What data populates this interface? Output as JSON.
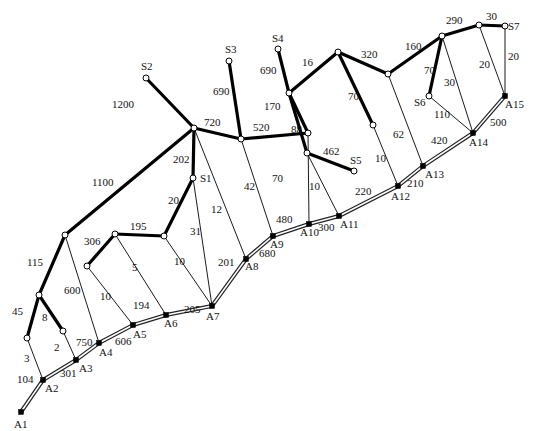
{
  "diagram": {
    "trunk_nodes": [
      {
        "id": "A1",
        "x": 21,
        "y": 412,
        "lx": 14,
        "ly": 428
      },
      {
        "id": "A2",
        "x": 43,
        "y": 380,
        "lx": 45,
        "ly": 392
      },
      {
        "id": "A3",
        "x": 76,
        "y": 360,
        "lx": 79,
        "ly": 372
      },
      {
        "id": "A4",
        "x": 99,
        "y": 343,
        "lx": 99,
        "ly": 356
      },
      {
        "id": "A5",
        "x": 133,
        "y": 325,
        "lx": 133,
        "ly": 338
      },
      {
        "id": "A6",
        "x": 166,
        "y": 315,
        "lx": 164,
        "ly": 327
      },
      {
        "id": "A7",
        "x": 212,
        "y": 306,
        "lx": 206,
        "ly": 320
      },
      {
        "id": "A8",
        "x": 246,
        "y": 259,
        "lx": 245,
        "ly": 270
      },
      {
        "id": "A9",
        "x": 273,
        "y": 236,
        "lx": 270,
        "ly": 248
      },
      {
        "id": "A10",
        "x": 309,
        "y": 224,
        "lx": 300,
        "ly": 236
      },
      {
        "id": "A11",
        "x": 339,
        "y": 216,
        "lx": 340,
        "ly": 228
      },
      {
        "id": "A12",
        "x": 398,
        "y": 186,
        "lx": 391,
        "ly": 200
      },
      {
        "id": "A13",
        "x": 423,
        "y": 166,
        "lx": 425,
        "ly": 178
      },
      {
        "id": "A14",
        "x": 473,
        "y": 133,
        "lx": 469,
        "ly": 146
      },
      {
        "id": "A15",
        "x": 505,
        "y": 96,
        "lx": 505,
        "ly": 108
      }
    ],
    "trunk_segments": [
      {
        "from": "A1",
        "to": "A2",
        "label": "104",
        "lx": 17,
        "ly": 383
      },
      {
        "from": "A2",
        "to": "A3",
        "label": "301",
        "lx": 60,
        "ly": 377
      },
      {
        "from": "A3",
        "to": "A4",
        "label": "750",
        "lx": 76,
        "ly": 346
      },
      {
        "from": "A4",
        "to": "A5",
        "label": "606",
        "lx": 115,
        "ly": 345
      },
      {
        "from": "A5",
        "to": "A6",
        "label": "194",
        "lx": 133,
        "ly": 309
      },
      {
        "from": "A6",
        "to": "A7",
        "label": "205",
        "lx": 184,
        "ly": 313
      },
      {
        "from": "A7",
        "to": "A8",
        "label": "201",
        "lx": 218,
        "ly": 266
      },
      {
        "from": "A8",
        "to": "A9",
        "label": "680",
        "lx": 259,
        "ly": 257
      },
      {
        "from": "A9",
        "to": "A10",
        "label": "480",
        "lx": 276,
        "ly": 223
      },
      {
        "from": "A10",
        "to": "A11",
        "label": "300",
        "lx": 318,
        "ly": 231
      },
      {
        "from": "A11",
        "to": "A12",
        "label": "220",
        "lx": 355,
        "ly": 195
      },
      {
        "from": "A12",
        "to": "A13",
        "label": "210",
        "lx": 407,
        "ly": 187
      },
      {
        "from": "A13",
        "to": "A14",
        "label": "420",
        "lx": 431,
        "ly": 144
      },
      {
        "from": "A14",
        "to": "A15",
        "label": "500",
        "lx": 490,
        "ly": 126
      }
    ],
    "open_nodes": [
      {
        "id": "S1",
        "x": 193,
        "y": 178,
        "label": "S1",
        "lx": 200,
        "ly": 182
      },
      {
        "id": "S2",
        "x": 146,
        "y": 78,
        "label": "S2",
        "lx": 141,
        "ly": 70
      },
      {
        "id": "S3",
        "x": 229,
        "y": 61,
        "label": "S3",
        "lx": 225,
        "ly": 53
      },
      {
        "id": "S4",
        "x": 278,
        "y": 49,
        "label": "S4",
        "lx": 272,
        "ly": 42
      },
      {
        "id": "S5",
        "x": 354,
        "y": 171,
        "label": "S5",
        "lx": 350,
        "ly": 164
      },
      {
        "id": "S6",
        "x": 429,
        "y": 96,
        "label": "S6",
        "lx": 414,
        "ly": 106
      },
      {
        "id": "S7",
        "x": 505,
        "y": 26,
        "label": "S7",
        "lx": 508,
        "ly": 30
      },
      {
        "id": "J720",
        "x": 194,
        "y": 128,
        "label": ""
      },
      {
        "id": "J520",
        "x": 241,
        "y": 139,
        "label": ""
      },
      {
        "id": "J88",
        "x": 308,
        "y": 133,
        "label": ""
      },
      {
        "id": "J170",
        "x": 289,
        "y": 93,
        "label": ""
      },
      {
        "id": "Jtop",
        "x": 338,
        "y": 52,
        "label": ""
      },
      {
        "id": "J320",
        "x": 388,
        "y": 74,
        "label": ""
      },
      {
        "id": "J160",
        "x": 442,
        "y": 36,
        "label": ""
      },
      {
        "id": "J290",
        "x": 479,
        "y": 25,
        "label": ""
      },
      {
        "id": "J70",
        "x": 373,
        "y": 125,
        "label": ""
      },
      {
        "id": "J462",
        "x": 307,
        "y": 153,
        "label": ""
      },
      {
        "id": "J1100",
        "x": 65,
        "y": 235,
        "label": ""
      },
      {
        "id": "J115",
        "x": 39,
        "y": 295,
        "label": ""
      },
      {
        "id": "J45",
        "x": 27,
        "y": 338,
        "label": ""
      },
      {
        "id": "J8",
        "x": 63,
        "y": 331,
        "label": ""
      },
      {
        "id": "J306",
        "x": 87,
        "y": 266,
        "label": ""
      },
      {
        "id": "J195a",
        "x": 115,
        "y": 234,
        "label": ""
      },
      {
        "id": "J195b",
        "x": 164,
        "y": 236,
        "label": ""
      }
    ],
    "thick_edges": [
      {
        "from": "J720",
        "to": "S2",
        "label": "1200",
        "lx": 112,
        "ly": 108
      },
      {
        "from": "J720",
        "to": "J520",
        "label": "720",
        "lx": 204,
        "ly": 126
      },
      {
        "from": "J720",
        "to": "S1",
        "label": "202",
        "lx": 173,
        "ly": 163
      },
      {
        "from": "J720",
        "to": "J1100",
        "label": "1100",
        "lx": 92,
        "ly": 186
      },
      {
        "from": "J520",
        "to": "S3",
        "label": "690",
        "lx": 213,
        "ly": 95
      },
      {
        "from": "J520",
        "to": "J88",
        "label": "520",
        "lx": 253,
        "ly": 131
      },
      {
        "from": "J88",
        "to": "J170",
        "label": "170",
        "lx": 264,
        "ly": 110
      },
      {
        "from": "J170",
        "to": "S4",
        "label": "690",
        "lx": 260,
        "ly": 74
      },
      {
        "from": "J170",
        "to": "Jtop",
        "label": "16",
        "lx": 302,
        "ly": 66
      },
      {
        "from": "J170",
        "to": "J462",
        "label": "88",
        "lx": 291,
        "ly": 133
      },
      {
        "from": "J462",
        "to": "S5",
        "label": "462",
        "lx": 323,
        "ly": 155
      },
      {
        "from": "Jtop",
        "to": "J320",
        "label": "320",
        "lx": 361,
        "ly": 58
      },
      {
        "from": "Jtop",
        "to": "J70",
        "label": "70",
        "lx": 348,
        "ly": 100
      },
      {
        "from": "J320",
        "to": "J160",
        "label": "160",
        "lx": 405,
        "ly": 50
      },
      {
        "from": "J160",
        "to": "J290",
        "label": "290",
        "lx": 446,
        "ly": 24
      },
      {
        "from": "J290",
        "to": "S7",
        "label": "30",
        "lx": 486,
        "ly": 20
      },
      {
        "from": "J160",
        "to": "S6",
        "label": "70",
        "lx": 424,
        "ly": 74
      },
      {
        "from": "S1",
        "to": "J195b",
        "label": "20",
        "lx": 168,
        "ly": 204
      },
      {
        "from": "J195a",
        "to": "J195b",
        "label": "195",
        "lx": 130,
        "ly": 230
      },
      {
        "from": "J195a",
        "to": "J306",
        "label": "306",
        "lx": 84,
        "ly": 245
      },
      {
        "from": "J1100",
        "to": "J115",
        "label": "115",
        "lx": 27,
        "ly": 266
      },
      {
        "from": "J115",
        "to": "J45",
        "label": "45",
        "lx": 12,
        "ly": 315
      },
      {
        "from": "J115",
        "to": "J8",
        "label": "8",
        "lx": 42,
        "ly": 321
      }
    ],
    "thin_edges": [
      {
        "from": "J45",
        "to": "A2",
        "label": "3",
        "lx": 24,
        "ly": 362
      },
      {
        "from": "J8",
        "to": "A3",
        "label": "2",
        "lx": 54,
        "ly": 351
      },
      {
        "from": "J1100",
        "to": "A4",
        "label": "600",
        "lx": 64,
        "ly": 294
      },
      {
        "from": "J306",
        "to": "A5",
        "label": "10",
        "lx": 100,
        "ly": 300
      },
      {
        "from": "J195a",
        "to": "A6",
        "label": "5",
        "lx": 132,
        "ly": 271
      },
      {
        "from": "J195b",
        "to": "A7",
        "label": "10",
        "lx": 174,
        "ly": 265
      },
      {
        "from": "S1",
        "to": "A7",
        "label": "31",
        "lx": 190,
        "ly": 235
      },
      {
        "from": "J720",
        "to": "A8",
        "label": "12",
        "lx": 211,
        "ly": 213
      },
      {
        "from": "J520",
        "to": "A9",
        "label": "42",
        "lx": 244,
        "ly": 190
      },
      {
        "from": "J88",
        "to": "A10",
        "label": "70",
        "lx": 272,
        "ly": 182
      },
      {
        "from": "J462",
        "to": "A11",
        "label": "10",
        "lx": 309,
        "ly": 190
      },
      {
        "from": "J70",
        "to": "A12",
        "label": "10",
        "lx": 375,
        "ly": 162
      },
      {
        "from": "J320",
        "to": "A13",
        "label": "62",
        "lx": 393,
        "ly": 138
      },
      {
        "from": "S6",
        "to": "A14",
        "label": "110",
        "lx": 434,
        "ly": 118
      },
      {
        "from": "J160",
        "to": "A14",
        "label": "30",
        "lx": 444,
        "ly": 86
      },
      {
        "from": "J290",
        "to": "A15",
        "label": "20",
        "lx": 479,
        "ly": 68
      },
      {
        "from": "S7",
        "to": "A15",
        "label": "20",
        "lx": 508,
        "ly": 60
      }
    ]
  }
}
